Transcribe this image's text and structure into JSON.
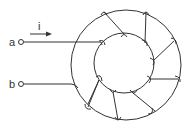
{
  "diagram": {
    "terminals": [
      {
        "id": "a",
        "label": "a"
      },
      {
        "id": "b",
        "label": "b"
      }
    ],
    "current": {
      "label": "i",
      "direction": "right"
    },
    "colors": {
      "stroke": "#333333",
      "background": "#ffffff"
    },
    "turns": 8
  }
}
